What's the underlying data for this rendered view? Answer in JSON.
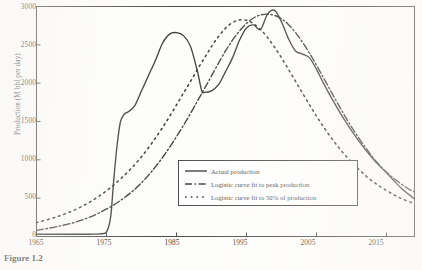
{
  "figure": {
    "caption": "Figure 1.2",
    "axes": {
      "ylabel": "Production (M bbl per day)",
      "xlabel": "",
      "ytick_labels": [
        "0",
        "500",
        "1000",
        "1500",
        "2000",
        "2500",
        "3000"
      ],
      "xtick_labels": [
        "1965",
        "1975",
        "1985",
        "1995",
        "2005",
        "2015"
      ]
    },
    "legend": {
      "items": [
        {
          "label": "Actual production",
          "style": "solid"
        },
        {
          "label": "Logistic curve fit to peak production",
          "style": "dash-dot"
        },
        {
          "label": "Logistic curve fit to 50% of production",
          "style": "dotted"
        }
      ]
    },
    "colors": {
      "ink": "#1a1a1a",
      "frame": "#2b2b29",
      "paper": "#fdfdfc"
    }
  },
  "chart_data": {
    "type": "line",
    "title": "",
    "xlabel": "",
    "ylabel": "Production (M bbl per day)",
    "xlim": [
      1965,
      2019
    ],
    "ylim": [
      0,
      3000
    ],
    "grid": false,
    "legend_position": "lower-right-inside",
    "xticks": [
      1965,
      1975,
      1985,
      1995,
      2005,
      2015
    ],
    "yticks": [
      0,
      500,
      1000,
      1500,
      2000,
      2500,
      3000
    ],
    "series": [
      {
        "name": "Actual production",
        "style": "solid",
        "x": [
          1965,
          1967,
          1969,
          1971,
          1973,
          1974,
          1975,
          1975.6,
          1976,
          1976.5,
          1977,
          1977.6,
          1978,
          1979,
          1980,
          1981,
          1982,
          1983,
          1984,
          1985,
          1986,
          1987,
          1988,
          1988.6,
          1989,
          1990,
          1991,
          1992,
          1993,
          1994,
          1995,
          1996,
          1997,
          1998,
          1999,
          2000,
          2001,
          2002,
          2003,
          2004,
          2005,
          2006,
          2007,
          2009,
          2011,
          2013,
          2015,
          2017,
          2019
        ],
        "y": [
          30,
          30,
          30,
          30,
          30,
          35,
          60,
          260,
          700,
          1180,
          1500,
          1600,
          1620,
          1700,
          1900,
          2100,
          2300,
          2520,
          2640,
          2660,
          2620,
          2480,
          2150,
          1900,
          1880,
          1900,
          1980,
          2150,
          2330,
          2560,
          2720,
          2760,
          2700,
          2900,
          2950,
          2800,
          2580,
          2420,
          2380,
          2330,
          2180,
          2000,
          1830,
          1520,
          1250,
          1020,
          830,
          640,
          490
        ]
      },
      {
        "name": "Logistic curve fit to peak production",
        "style": "dash-dot",
        "x": [
          1965,
          1968,
          1971,
          1974,
          1977,
          1980,
          1983,
          1986,
          1989,
          1992,
          1994,
          1996,
          1998,
          2000,
          2002,
          2004,
          2006,
          2008,
          2010,
          2012,
          2014,
          2016,
          2018,
          2019
        ],
        "y": [
          80,
          130,
          200,
          310,
          470,
          700,
          1030,
          1450,
          1930,
          2420,
          2680,
          2850,
          2900,
          2840,
          2660,
          2390,
          2070,
          1740,
          1430,
          1160,
          930,
          760,
          630,
          580
        ]
      },
      {
        "name": "Logistic curve fit to 50% of production",
        "style": "dotted",
        "x": [
          1965,
          1968,
          1971,
          1974,
          1977,
          1980,
          1983,
          1986,
          1989,
          1991,
          1993,
          1995,
          1997,
          1999,
          2001,
          2003,
          2005,
          2007,
          2009,
          2011,
          2013,
          2015,
          2017,
          2019
        ],
        "y": [
          180,
          260,
          370,
          530,
          750,
          1040,
          1420,
          1870,
          2330,
          2610,
          2790,
          2820,
          2700,
          2470,
          2180,
          1870,
          1570,
          1300,
          1070,
          880,
          720,
          600,
          500,
          430
        ]
      }
    ]
  }
}
